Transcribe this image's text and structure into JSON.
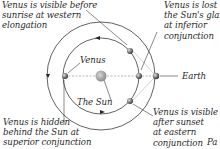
{
  "diagram": {
    "type": "orbital-diagram",
    "labels": {
      "western_elongation": [
        "Venus is visible before",
        "sunrise at western",
        "elongation"
      ],
      "inferior_conjunction": [
        "Venus is lost in",
        "the Sun's glare",
        "at inferior",
        "conjunction"
      ],
      "superior_conjunction": [
        "Venus is hidden",
        "behind the Sun at",
        "superior conjunction"
      ],
      "eastern_elongation": [
        "Venus is visible",
        "after sunset",
        "at eastern",
        "conjunction"
      ],
      "venus": "Venus",
      "sun": "The Sun",
      "earth": "Earth",
      "cut_off_text": "Pa"
    },
    "colors": {
      "orbit": "#3a3a3a",
      "dashed_line": "#9a9a9a",
      "sun": "#a8a8a8",
      "text": "#2a2a2a"
    }
  }
}
